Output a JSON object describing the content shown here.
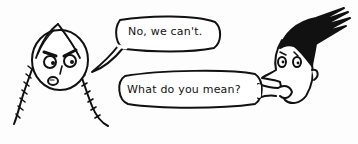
{
  "panel": {
    "characters": [
      {
        "name": "girl-with-braids",
        "expression": "angry"
      },
      {
        "name": "boy-with-spiky-hair",
        "expression": "surprised"
      }
    ],
    "bubbles": [
      {
        "speaker": "girl-with-braids",
        "text": "No, we can't."
      },
      {
        "speaker": "boy-with-spiky-hair",
        "text": "What do you mean?"
      }
    ]
  }
}
